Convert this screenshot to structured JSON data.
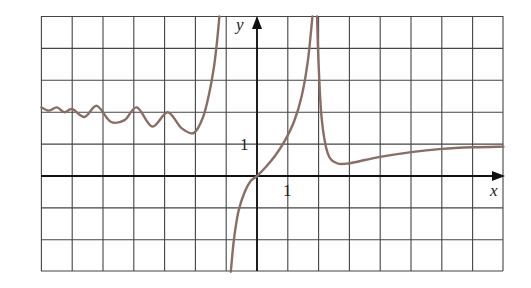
{
  "chart_data": {
    "type": "line",
    "title": "",
    "xlabel": "x",
    "ylabel": "y",
    "xlim": [
      -7,
      8
    ],
    "ylim": [
      -3,
      5
    ],
    "grid": true,
    "x_tick_labels": [
      {
        "value": 1,
        "label": "1"
      }
    ],
    "y_tick_labels": [
      {
        "value": 1,
        "label": "1"
      }
    ],
    "vertical_asymptotes": [
      -1.2,
      1.9
    ],
    "horizontal_asymptote_right": 1,
    "colors": {
      "curve": "#8b6d63",
      "grid": "#444444",
      "axis": "#111111"
    },
    "series": [
      {
        "name": "left branch (damped oscillation)",
        "x": [
          -7.0,
          -6.75,
          -6.5,
          -6.25,
          -6.0,
          -5.6,
          -5.2,
          -4.75,
          -4.3,
          -3.9,
          -3.4,
          -2.9,
          -2.45,
          -2.05,
          -1.75,
          -1.55,
          -1.4,
          -1.3,
          -1.22
        ],
        "y": [
          2.15,
          2.05,
          2.15,
          2.0,
          2.1,
          1.85,
          2.2,
          1.7,
          1.75,
          2.15,
          1.55,
          2.0,
          1.5,
          1.35,
          1.85,
          2.6,
          3.4,
          4.2,
          5.0
        ]
      },
      {
        "name": "middle branch",
        "x": [
          -0.85,
          -0.75,
          -0.6,
          -0.4,
          -0.2,
          0.0,
          0.3,
          0.6,
          0.9,
          1.2,
          1.45,
          1.65,
          1.8
        ],
        "y": [
          -3.0,
          -2.0,
          -1.1,
          -0.5,
          -0.15,
          0.0,
          0.3,
          0.65,
          1.1,
          1.7,
          2.5,
          3.6,
          5.0
        ]
      },
      {
        "name": "right branch",
        "x": [
          1.95,
          2.0,
          2.1,
          2.3,
          2.6,
          3.0,
          3.5,
          4.0,
          5.0,
          6.0,
          7.0,
          8.0
        ],
        "y": [
          5.0,
          3.5,
          1.8,
          0.7,
          0.4,
          0.4,
          0.5,
          0.6,
          0.75,
          0.85,
          0.9,
          0.92
        ]
      }
    ]
  },
  "axes": {
    "x_label": "x",
    "y_label": "y",
    "x_tick": "1",
    "y_tick": "1"
  }
}
